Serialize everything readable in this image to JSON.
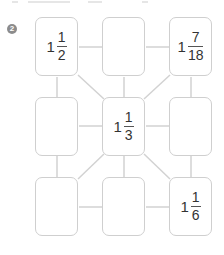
{
  "problem": {
    "number_badge": "2",
    "grid": [
      [
        {
          "whole": "1",
          "numerator": "1",
          "denominator": "2"
        },
        null,
        {
          "whole": "1",
          "numerator": "7",
          "denominator": "18"
        }
      ],
      [
        null,
        {
          "whole": "1",
          "numerator": "1",
          "denominator": "3"
        },
        null
      ],
      [
        null,
        null,
        {
          "whole": "1",
          "numerator": "1",
          "denominator": "6"
        }
      ]
    ]
  },
  "colors": {
    "box_border": "#cfcfcf",
    "connector": "#d2d2d2",
    "text": "#333333",
    "badge": "#8c8c8c"
  }
}
